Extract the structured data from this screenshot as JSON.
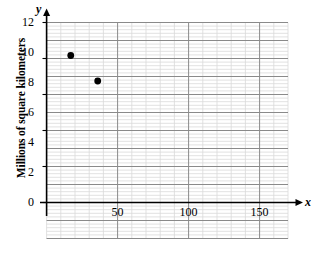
{
  "chart_data": {
    "type": "scatter",
    "title": "",
    "xlabel": "x",
    "ylabel": "y",
    "y_axis_title": "Millions of square kilometers",
    "xlim": [
      0,
      170
    ],
    "ylim": [
      -1.5,
      12.8
    ],
    "x_ticks": [
      50,
      100,
      150
    ],
    "x_tick_labels": [
      "50",
      "100",
      "150"
    ],
    "y_ticks": [
      0,
      2,
      4,
      6,
      8,
      10,
      12
    ],
    "y_tick_labels": [
      "0",
      "2",
      "4",
      "6",
      "8",
      "10",
      "12"
    ],
    "grid": true,
    "grid_major_x_step": 50,
    "grid_minor_x_step": 10,
    "grid_major_y_step": 2,
    "grid_minor_y_step": 0.4,
    "legend": "none",
    "points": [
      {
        "x": 17,
        "y": 9.8,
        "label": ""
      },
      {
        "x": 36,
        "y": 8.1,
        "label": ""
      }
    ],
    "point_color": "#000000",
    "grid_major_color": "#808080",
    "grid_minor_color": "#d8d8d8",
    "axis_color": "#000000"
  },
  "axes": {
    "x_name": "x",
    "y_name": "y"
  },
  "labels": {
    "y_axis_title": "Millions of square kilometers",
    "y_0": "0",
    "y_2": "2",
    "y_4": "4",
    "y_6": "6",
    "y_8": "8",
    "y_10": "10",
    "y_12": "12",
    "x_50": "50",
    "x_100": "100",
    "x_150": "150"
  }
}
